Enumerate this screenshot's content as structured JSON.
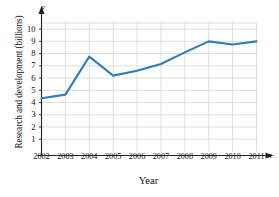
{
  "chart_data": {
    "type": "line",
    "title": "",
    "xlabel": "Year",
    "ylabel": "Research and development (billions)",
    "categories": [
      "2002",
      "2003",
      "2004",
      "2005",
      "2006",
      "2007",
      "2008",
      "2009",
      "2010",
      "2011"
    ],
    "x": [
      2002,
      2003,
      2004,
      2005,
      2006,
      2007,
      2008,
      2009,
      2010,
      2011
    ],
    "values": [
      4.35,
      4.65,
      7.75,
      6.2,
      6.6,
      7.15,
      8.1,
      9.0,
      8.75,
      9.0
    ],
    "series": [
      {
        "name": "Research and development",
        "values": [
          4.35,
          4.65,
          7.75,
          6.2,
          6.6,
          7.15,
          8.1,
          9.0,
          8.75,
          9.0
        ]
      }
    ],
    "xlim": [
      2002,
      2011
    ],
    "ylim": [
      0,
      10.5
    ],
    "yticks": [
      1,
      2,
      3,
      4,
      5,
      6,
      7,
      8,
      9,
      10
    ],
    "ytick_labels": [
      "1",
      "2",
      "3",
      "4",
      "5",
      "6",
      "7",
      "8",
      "9",
      "10"
    ],
    "xticks": [
      2002,
      2003,
      2004,
      2005,
      2006,
      2007,
      2008,
      2009,
      2010,
      2011
    ],
    "xtick_labels": [
      "2002",
      "2003",
      "2004",
      "2005",
      "2006",
      "2007",
      "2008",
      "2009",
      "2010",
      "2011"
    ],
    "grid": true,
    "legend": false,
    "legend_position": "none",
    "axis_letters": {
      "x": "x",
      "y": "y"
    },
    "colors": {
      "line": "#2E7EBB",
      "grid": "#c9c9c9",
      "axis": "#222222",
      "background": "#ffffff",
      "text": "#111111"
    },
    "line_width": 2.1,
    "markers": false
  }
}
